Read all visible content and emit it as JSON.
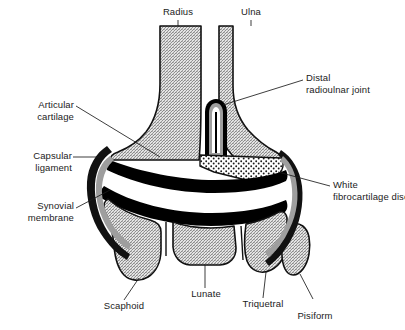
{
  "figure": {
    "background_color": "#ffffff",
    "line_color": "#111111",
    "bone_fill_color": "#c9c9c9",
    "cartilage_color": "#000000",
    "synovial_color": "#9e9e9e",
    "disc_color": "#ffffff",
    "text_color": "#1b1b1b"
  },
  "labels": {
    "radius": "Radius",
    "ulna": "Ulna",
    "distal_radioulnar_joint": "Distal\nradioulnar joint",
    "articular_cartilage": "Articular\ncartilage",
    "capsular_ligament": "Capsular\nligament",
    "synovial_membrane": "Synovial\nmembrane",
    "white_fibrocartilage_disc": "White\nfibrocartilage disc",
    "lunate": "Lunate",
    "scaphoid": "Scaphoid",
    "triquetral": "Triquetral",
    "pisiform": "Pisiform"
  },
  "structures": [
    {
      "name": "radius",
      "kind": "bone",
      "label": "Radius"
    },
    {
      "name": "ulna",
      "kind": "bone",
      "label": "Ulna"
    },
    {
      "name": "scaphoid",
      "kind": "carpal-bone",
      "label": "Scaphoid"
    },
    {
      "name": "lunate",
      "kind": "carpal-bone",
      "label": "Lunate"
    },
    {
      "name": "triquetral",
      "kind": "carpal-bone",
      "label": "Triquetral"
    },
    {
      "name": "pisiform",
      "kind": "carpal-bone",
      "label": "Pisiform"
    },
    {
      "name": "articular-cartilage",
      "kind": "cartilage",
      "label": "Articular cartilage"
    },
    {
      "name": "capsular-ligament",
      "kind": "ligament",
      "label": "Capsular ligament"
    },
    {
      "name": "synovial-membrane",
      "kind": "membrane",
      "label": "Synovial membrane"
    },
    {
      "name": "white-fibrocartilage-disc",
      "kind": "disc",
      "label": "White fibrocartilage disc"
    },
    {
      "name": "distal-radioulnar-joint",
      "kind": "joint-cavity",
      "label": "Distal radioulnar joint"
    }
  ]
}
